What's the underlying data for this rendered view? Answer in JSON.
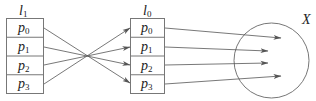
{
  "left_list": {
    "label": "l",
    "label_sub": "1",
    "items": [
      {
        "name": "p",
        "sub": "0"
      },
      {
        "name": "p",
        "sub": "1"
      },
      {
        "name": "p",
        "sub": "2"
      },
      {
        "name": "p",
        "sub": "3"
      }
    ]
  },
  "right_list": {
    "label": "l",
    "label_sub": "0",
    "items": [
      {
        "name": "p",
        "sub": "0"
      },
      {
        "name": "p",
        "sub": "1"
      },
      {
        "name": "p",
        "sub": "2"
      },
      {
        "name": "p",
        "sub": "3"
      }
    ]
  },
  "set": {
    "label": "X"
  },
  "colors": {
    "stroke": "#555555",
    "text": "#222222"
  }
}
